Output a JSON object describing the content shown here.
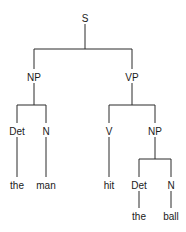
{
  "diagram": {
    "type": "syntax-tree",
    "colors": {
      "line": "#2a2a2a",
      "text": "#1a1a1a",
      "background": "#ffffff"
    },
    "nodes": [
      {
        "id": "S",
        "label": "S",
        "x": 85,
        "y": 18
      },
      {
        "id": "NP1",
        "label": "NP",
        "x": 34,
        "y": 77
      },
      {
        "id": "VP",
        "label": "VP",
        "x": 132,
        "y": 77
      },
      {
        "id": "Det1",
        "label": "Det",
        "x": 17,
        "y": 131
      },
      {
        "id": "N1",
        "label": "N",
        "x": 46,
        "y": 131
      },
      {
        "id": "V",
        "label": "V",
        "x": 109,
        "y": 131
      },
      {
        "id": "NP2",
        "label": "NP",
        "x": 155,
        "y": 131
      },
      {
        "id": "the1",
        "label": "the",
        "x": 17,
        "y": 185
      },
      {
        "id": "man",
        "label": "man",
        "x": 46,
        "y": 185
      },
      {
        "id": "hit",
        "label": "hit",
        "x": 109,
        "y": 185
      },
      {
        "id": "Det2",
        "label": "Det",
        "x": 139,
        "y": 185
      },
      {
        "id": "N2",
        "label": "N",
        "x": 171,
        "y": 185
      },
      {
        "id": "the2",
        "label": "the",
        "x": 139,
        "y": 216
      },
      {
        "id": "ball",
        "label": "ball",
        "x": 171,
        "y": 216
      }
    ],
    "edges": [
      [
        "S",
        "NP1"
      ],
      [
        "S",
        "VP"
      ],
      [
        "NP1",
        "Det1"
      ],
      [
        "NP1",
        "N1"
      ],
      [
        "VP",
        "V"
      ],
      [
        "VP",
        "NP2"
      ],
      [
        "Det1",
        "the1"
      ],
      [
        "N1",
        "man"
      ],
      [
        "V",
        "hit"
      ],
      [
        "NP2",
        "Det2"
      ],
      [
        "NP2",
        "N2"
      ],
      [
        "Det2",
        "the2"
      ],
      [
        "N2",
        "ball"
      ]
    ]
  }
}
